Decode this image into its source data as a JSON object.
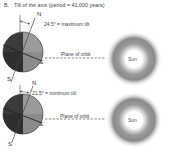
{
  "figure": {
    "panel_letter": "B.",
    "title": "Tilt of the axis (period = 41,000 years)"
  },
  "panels": [
    {
      "id": "maximum",
      "tilt_label": "24.5° = maximum tilt",
      "north_label": "N",
      "south_label": "S",
      "equator_label": "E",
      "orbit_label": "Plane of orbit",
      "sun_label": "Sun"
    },
    {
      "id": "minimum",
      "tilt_label": "21.5° = minimum tilt",
      "north_label": "N",
      "south_label": "S",
      "equator_label": "E",
      "orbit_label": "Plane of orbit",
      "sun_label": "Sun"
    }
  ],
  "colors": {
    "earth_dark": "#3a3a3a",
    "earth_light": "#9a9a9a",
    "sun_glow": "#8a8a8a",
    "line": "#444444"
  }
}
